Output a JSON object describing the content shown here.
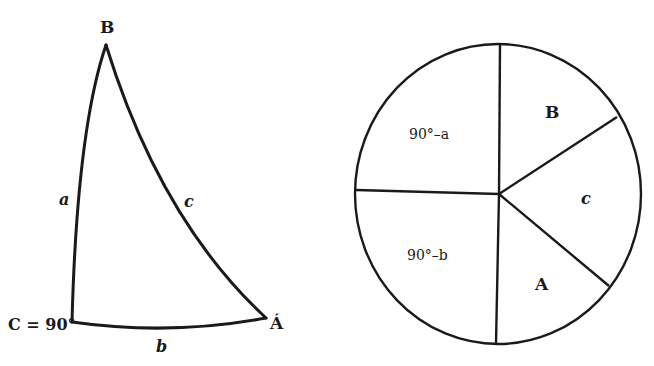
{
  "triangle": {
    "vertices": {
      "B": {
        "label": "B",
        "x": 106,
        "y": 42
      },
      "C": {
        "label": "C = 90°",
        "x": 72,
        "y": 322
      },
      "A": {
        "label": "Á",
        "x": 266,
        "y": 318
      }
    },
    "sides": {
      "a": {
        "label": "a",
        "x": 64,
        "y": 203
      },
      "b": {
        "label": "b",
        "x": 162,
        "y": 349
      },
      "c": {
        "label": "c",
        "x": 189,
        "y": 205
      }
    }
  },
  "circle": {
    "center": {
      "x": 498,
      "y": 194
    },
    "rx": 143,
    "ry": 150,
    "sectors": [
      {
        "label": "90°–a",
        "x": 433,
        "y": 136
      },
      {
        "label": "B",
        "x": 550,
        "y": 116
      },
      {
        "label": "c",
        "x": 585,
        "y": 202
      },
      {
        "label": "A",
        "x": 541,
        "y": 285
      },
      {
        "label": "90°–b",
        "x": 432,
        "y": 258
      }
    ]
  },
  "colors": {
    "ink": "#1a1a1a",
    "background": "#ffffff"
  }
}
